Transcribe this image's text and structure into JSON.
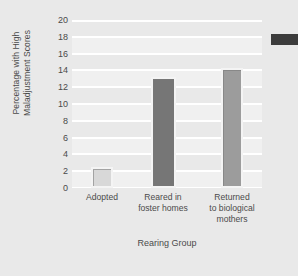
{
  "chart_data": {
    "type": "bar",
    "title": "",
    "xlabel": "Rearing Group",
    "ylabel": "Percentage with High Maladjustment Scores",
    "ylabel_lines": [
      "Percentage with High",
      "Maladjustment Scores"
    ],
    "categories": [
      "Adopted",
      "Reared in\nfoster homes",
      "Returned\nto biological\nmothers"
    ],
    "values": [
      2.5,
      13.2,
      14.3
    ],
    "ylim": [
      0,
      20
    ],
    "yticks": [
      0,
      2,
      4,
      6,
      8,
      10,
      12,
      14,
      16,
      18,
      20
    ],
    "ytick_labels": [
      "0",
      "2",
      "4",
      "6",
      "8",
      "10",
      "12",
      "14",
      "16",
      "18",
      "20"
    ],
    "grid": true,
    "legend": "none",
    "bar_colors": [
      "#d8d8d8",
      "#767676",
      "#9c9c9c"
    ],
    "background": "#e9e9e9",
    "plot_background": "#fbfbfb",
    "gridline_color": "#ffffff"
  },
  "figure": {
    "artifact_color": "#3c3c3c"
  }
}
